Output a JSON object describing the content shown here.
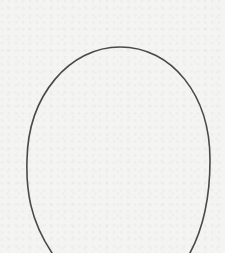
{
  "drawing": {
    "background_color": "#f4f4f2",
    "shape": {
      "type": "egg-outline",
      "stroke_color": "#4a4a4a",
      "stroke_width": 1.6,
      "top": {
        "x": 120,
        "y": 47
      },
      "left": {
        "x": 27,
        "y": 165
      },
      "right": {
        "x": 210,
        "y": 160
      },
      "bottom_cut_left": {
        "x": 52,
        "y": 253
      },
      "bottom_cut_right": {
        "x": 190,
        "y": 253
      }
    }
  }
}
